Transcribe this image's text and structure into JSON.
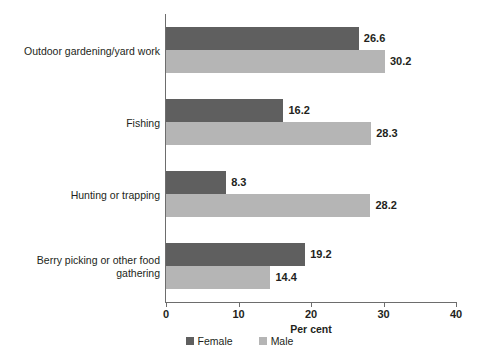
{
  "chart_data": {
    "type": "bar",
    "orientation": "horizontal",
    "title": "",
    "xlabel": "Per cent",
    "ylabel": "",
    "xlim": [
      0,
      40
    ],
    "xticks": [
      "0",
      "10",
      "20",
      "30",
      "40"
    ],
    "grid": false,
    "legend_position": "bottom-center",
    "categories": [
      "Outdoor gardening/yard work",
      "Fishing",
      "Hunting or trapping",
      "Berry picking or other food\ngathering"
    ],
    "series": [
      {
        "name": "Female",
        "color": "#5f5f5f",
        "values": [
          26.6,
          16.2,
          8.3,
          19.2
        ]
      },
      {
        "name": "Male",
        "color": "#b5b5b5",
        "values": [
          30.2,
          28.3,
          28.2,
          14.4
        ]
      }
    ],
    "data_labels": [
      [
        "26.6",
        "30.2"
      ],
      [
        "16.2",
        "28.3"
      ],
      [
        "8.3",
        "28.2"
      ],
      [
        "19.2",
        "14.4"
      ]
    ]
  },
  "axis": {
    "x_title": "Per cent",
    "ticks": [
      {
        "value": "0",
        "pos": 0
      },
      {
        "value": "10",
        "pos": 10
      },
      {
        "value": "20",
        "pos": 20
      },
      {
        "value": "30",
        "pos": 30
      },
      {
        "value": "40",
        "pos": 40
      }
    ]
  },
  "legend": {
    "items": [
      {
        "label": "Female",
        "color": "#5f5f5f"
      },
      {
        "label": "Male",
        "color": "#b5b5b5"
      }
    ]
  },
  "colors": {
    "female": "#5f5f5f",
    "male": "#b5b5b5",
    "axis": "#6d6d6d",
    "text": "#231f20",
    "background": "#ffffff"
  }
}
